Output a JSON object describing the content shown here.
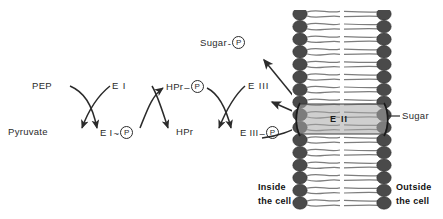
{
  "diagram": {
    "background": "#ffffff",
    "ink": "#2b2b2b",
    "membrane_head_color": "#4a4a4a",
    "membrane_tail_color": "#7d7d7d",
    "protein_band_color": "#9a9a9a"
  },
  "labels": {
    "pep": "PEP",
    "pyruvate": "Pyruvate",
    "ei": "E I",
    "ei_p_name": "E I",
    "ei_p_link": "~",
    "hpr_p_name": "HPr",
    "hpr_p_link": "–",
    "hpr": "HPr",
    "eiii": "E III",
    "eiii_p_name": "E III",
    "eiii_p_link": "–",
    "sugar_p_name": "Sugar",
    "sugar_p_link": "-",
    "phosphate": "P",
    "eii": "E II",
    "sugar_callout": "Sugar",
    "inside_line1": "Inside",
    "inside_line2": "the cell",
    "outside_line1": "Outside",
    "outside_line2": "the cell"
  },
  "icons": {
    "phosphate_circle": "circled-p-icon",
    "membrane": "phospholipid-bilayer-icon",
    "transporter": "eii-transporter-icon",
    "arrow_cycle": "curved-reaction-arrow-icon",
    "leader": "callout-leader-line-icon"
  }
}
